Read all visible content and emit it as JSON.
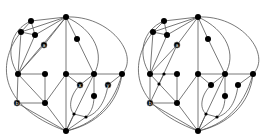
{
  "figure": {
    "type": "two planar graph drawings side by side",
    "background": "#ffffff",
    "node_color": "#000000",
    "edge_color": "#555555"
  },
  "graphs": [
    {
      "name": "left-graph",
      "labels": {
        "a": "a",
        "b": "b",
        "x": "x",
        "y": "y"
      },
      "nodes": [
        {
          "id": "t",
          "x": 66,
          "y": 17,
          "r": 3
        },
        {
          "id": "n1",
          "x": 31,
          "y": 21,
          "r": 3
        },
        {
          "id": "n2",
          "x": 21,
          "y": 32,
          "r": 3
        },
        {
          "id": "n3",
          "x": 35,
          "y": 35,
          "r": 3
        },
        {
          "id": "a",
          "x": 44,
          "y": 45,
          "r": 3,
          "label": "a"
        },
        {
          "id": "n4",
          "x": 77,
          "y": 39,
          "r": 3
        },
        {
          "id": "m1",
          "x": 18,
          "y": 74,
          "r": 3
        },
        {
          "id": "m2",
          "x": 45,
          "y": 74,
          "r": 3
        },
        {
          "id": "m3",
          "x": 66,
          "y": 74,
          "r": 3
        },
        {
          "id": "m4",
          "x": 94,
          "y": 74,
          "r": 3
        },
        {
          "id": "m5",
          "x": 122,
          "y": 74,
          "r": 3
        },
        {
          "id": "x",
          "x": 80,
          "y": 85,
          "r": 3,
          "label": "x"
        },
        {
          "id": "y",
          "x": 108,
          "y": 85,
          "r": 3,
          "label": "y"
        },
        {
          "id": "n5",
          "x": 94,
          "y": 96,
          "r": 3
        },
        {
          "id": "b",
          "x": 17,
          "y": 103,
          "r": 3,
          "label": "b"
        },
        {
          "id": "n6",
          "x": 45,
          "y": 103,
          "r": 3
        },
        {
          "id": "s1",
          "x": 74,
          "y": 114,
          "r": 1.6
        },
        {
          "id": "s2",
          "x": 86,
          "y": 117,
          "r": 1.6
        },
        {
          "id": "bt",
          "x": 66,
          "y": 131,
          "r": 3
        }
      ]
    },
    {
      "name": "right-graph",
      "labels": {
        "a": "a",
        "b": "b"
      },
      "nodes": [
        {
          "id": "t",
          "x": 198,
          "y": 17,
          "r": 3
        },
        {
          "id": "n1",
          "x": 164,
          "y": 21,
          "r": 3
        },
        {
          "id": "n2",
          "x": 153,
          "y": 32,
          "r": 3
        },
        {
          "id": "n3",
          "x": 167,
          "y": 35,
          "r": 3
        },
        {
          "id": "a",
          "x": 177,
          "y": 45,
          "r": 3,
          "label": "a"
        },
        {
          "id": "n4",
          "x": 208,
          "y": 39,
          "r": 3
        },
        {
          "id": "m1",
          "x": 150,
          "y": 74,
          "r": 3
        },
        {
          "id": "e1",
          "x": 164,
          "y": 74,
          "r": 1.6
        },
        {
          "id": "m2",
          "x": 177,
          "y": 74,
          "r": 3
        },
        {
          "id": "m3",
          "x": 198,
          "y": 74,
          "r": 3
        },
        {
          "id": "m4",
          "x": 225,
          "y": 74,
          "r": 3
        },
        {
          "id": "m5",
          "x": 253,
          "y": 74,
          "r": 3
        },
        {
          "id": "e2",
          "x": 159,
          "y": 84,
          "r": 1.6
        },
        {
          "id": "x",
          "x": 211,
          "y": 85,
          "r": 3
        },
        {
          "id": "y",
          "x": 238,
          "y": 85,
          "r": 3
        },
        {
          "id": "n5",
          "x": 225,
          "y": 96,
          "r": 3
        },
        {
          "id": "b",
          "x": 150,
          "y": 103,
          "r": 3,
          "label": "b"
        },
        {
          "id": "n6",
          "x": 177,
          "y": 103,
          "r": 3
        },
        {
          "id": "s1",
          "x": 206,
          "y": 114,
          "r": 1.6
        },
        {
          "id": "s2",
          "x": 217,
          "y": 117,
          "r": 1.6
        },
        {
          "id": "bt",
          "x": 198,
          "y": 131,
          "r": 3
        }
      ]
    }
  ]
}
